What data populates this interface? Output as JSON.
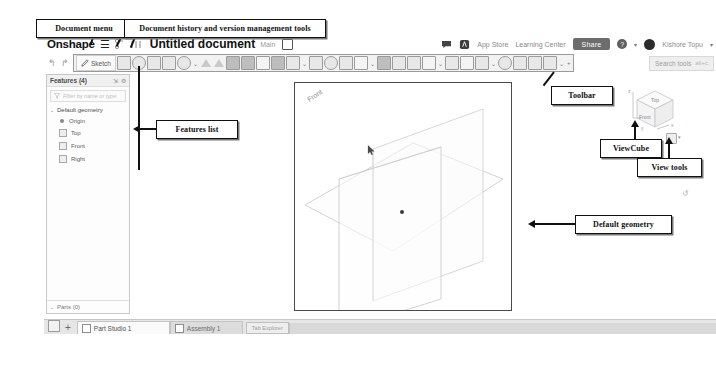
{
  "annotations": [
    {
      "id": "document-menu",
      "label": "Document menu"
    },
    {
      "id": "document-history",
      "label": "Document history and version management tools"
    },
    {
      "id": "features-list",
      "label": "Features list"
    },
    {
      "id": "toolbar",
      "label": "Toolbar"
    },
    {
      "id": "viewcube",
      "label": "ViewCube"
    },
    {
      "id": "view-tools",
      "label": "View tools"
    },
    {
      "id": "default-geometry",
      "label": "Default geometry"
    }
  ],
  "topbar": {
    "logo": "Onshape",
    "menu_icon": "hamburger-icon",
    "history_icon": "document-history-icon",
    "version_icon": "version-graph-icon",
    "document_title": "Untitled document",
    "branch": "Main",
    "workspace_icon": "workspace-icon",
    "comments_icon": "comments-icon",
    "apps_icon": "app-store-icon",
    "app_store": "App Store",
    "learning_center": "Learning Center",
    "share": "Share",
    "help_icon": "help-icon",
    "avatar": "user-avatar",
    "user_name": "Kishore Topu",
    "caret": "▾"
  },
  "toolbar": {
    "undo": "↰",
    "redo": "↱",
    "sketch_label": "Sketch",
    "sketch_icon": "sketch-pencil-icon",
    "search_placeholder": "Search tools",
    "search_shortcut": "alt+c",
    "plus_label": "+",
    "tools": [
      {
        "name": "plane-icon",
        "kind": "sq"
      },
      {
        "name": "sweep-icon",
        "kind": "round"
      },
      {
        "name": "loft-icon",
        "kind": "sq"
      },
      {
        "name": "rib-icon",
        "kind": "sq"
      },
      {
        "name": "hole-icon",
        "kind": "round"
      },
      {
        "name": "extrude-dropdown",
        "kind": "dd"
      },
      {
        "name": "extrude-icon",
        "kind": "tri"
      },
      {
        "name": "revolve-icon",
        "kind": "tri"
      },
      {
        "name": "sweep2-icon",
        "kind": "dk"
      },
      {
        "name": "loft2-icon",
        "kind": "dk"
      },
      {
        "name": "thicken-icon",
        "kind": "lt"
      },
      {
        "name": "enclose-icon",
        "kind": "dk"
      },
      {
        "name": "fillet-icon",
        "kind": "sq"
      },
      {
        "name": "fillet-dropdown",
        "kind": "dd"
      },
      {
        "name": "chamfer-icon",
        "kind": "sq"
      },
      {
        "name": "draft-icon",
        "kind": "round"
      },
      {
        "name": "shell-icon",
        "kind": "sq"
      },
      {
        "name": "transform-icon",
        "kind": "lt"
      },
      {
        "name": "transform-dropdown",
        "kind": "dd"
      },
      {
        "name": "boolean-icon",
        "kind": "dk"
      },
      {
        "name": "split-icon",
        "kind": "sq"
      },
      {
        "name": "mirror-icon",
        "kind": "sq"
      },
      {
        "name": "pattern-icon",
        "kind": "lt"
      },
      {
        "name": "pattern-dropdown",
        "kind": "dd"
      },
      {
        "name": "plane-tool-icon",
        "kind": "sq"
      },
      {
        "name": "axis-icon",
        "kind": "lt"
      },
      {
        "name": "sketch-point-icon",
        "kind": "sq"
      },
      {
        "name": "dropdown-2",
        "kind": "dd"
      },
      {
        "name": "measure-icon",
        "kind": "round"
      },
      {
        "name": "mass-icon",
        "kind": "sq"
      },
      {
        "name": "variable-icon",
        "kind": "sq"
      },
      {
        "name": "insert-icon",
        "kind": "sq"
      },
      {
        "name": "insert-dropdown",
        "kind": "dd"
      },
      {
        "name": "add-custom-feature",
        "kind": "plus"
      }
    ]
  },
  "features_panel": {
    "title": "Features (4)",
    "collapse_icon": "collapse-icon",
    "settings_icon": "gear-icon",
    "filter_icon": "filter-icon",
    "filter_placeholder": "Filter by name or type",
    "group": {
      "label": "Default geometry",
      "chevron": "⌄",
      "items": [
        {
          "label": "Origin",
          "icon": "origin-point-icon"
        },
        {
          "label": "Top",
          "icon": "plane-icon"
        },
        {
          "label": "Front",
          "icon": "plane-icon"
        },
        {
          "label": "Right",
          "icon": "plane-icon"
        }
      ]
    },
    "parts": {
      "label": "Parts (0)",
      "chevron": "⌄"
    }
  },
  "viewport": {
    "front_plane_label": "Front",
    "origin_name": "origin-point",
    "cursor_icon": "sketch-cursor-icon"
  },
  "viewcube": {
    "top_face": "Top",
    "front_face": "Front",
    "right_face": "Right",
    "axis_z": "z",
    "axis_x": "x",
    "axis_y": "y"
  },
  "view_tools": {
    "display_icon": "view-display-icon",
    "caret": "▾",
    "rotate_icon": "rotate-icon"
  },
  "tabbar": {
    "list_icon": "tab-list-icon",
    "add_label": "+",
    "tabs": [
      {
        "label": "Part Studio 1",
        "icon": "part-studio-icon",
        "active": true
      },
      {
        "label": "Assembly 1",
        "icon": "assembly-icon",
        "active": false
      }
    ],
    "explorer_label": "Tab Explorer"
  },
  "colors": {
    "accent": "#6d6d6d",
    "ink": "#111111",
    "panel": "#f2f2f2"
  }
}
